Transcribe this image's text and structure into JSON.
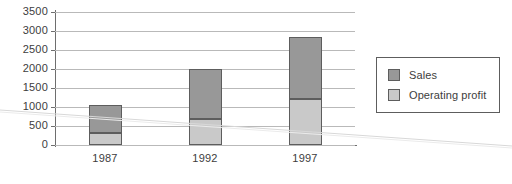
{
  "chart_data": {
    "type": "bar",
    "subtype": "stacked-bar",
    "title": "",
    "xlabel": "",
    "ylabel": "",
    "categories": [
      "1987",
      "1992",
      "1997"
    ],
    "series": [
      {
        "name": "Operating profit",
        "values": [
          320,
          680,
          1200
        ],
        "color": "#c9c9c9"
      },
      {
        "name": "Sales",
        "values": [
          730,
          1320,
          1650
        ],
        "color": "#989898"
      }
    ],
    "stack_totals": [
      1050,
      2000,
      2850
    ],
    "ylim": [
      0,
      3500
    ],
    "ytick_step": 500,
    "yticks": [
      "3500",
      "3000",
      "2500",
      "2000",
      "1500",
      "1000",
      "500",
      "0"
    ],
    "grid": true,
    "legend_position": "right",
    "legend_entries": [
      "Sales",
      "Operating profit"
    ]
  },
  "legend": {
    "items": [
      {
        "label": "Sales",
        "swatch": "sales"
      },
      {
        "label": "Operating profit",
        "swatch": "profit"
      }
    ]
  },
  "colors": {
    "sales": "#989898",
    "operating_profit": "#c9c9c9",
    "gridline": "#b9b9b9",
    "axis": "#6e6e6e",
    "text": "#3d3d3d",
    "background": "#ffffff"
  }
}
